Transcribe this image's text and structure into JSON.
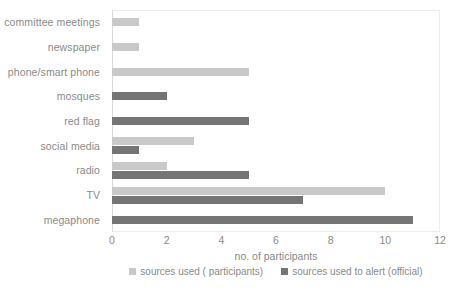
{
  "chart_data": {
    "type": "bar",
    "orientation": "horizontal",
    "title": "",
    "xlabel": "no. of participants",
    "ylabel": "",
    "xlim": [
      0,
      12
    ],
    "xticks": [
      0,
      2,
      4,
      6,
      8,
      10,
      12
    ],
    "grid": false,
    "legend_position": "bottom",
    "categories": [
      "committee meetings",
      "newspaper",
      "phone/smart phone",
      "mosques",
      "red flag",
      "social media",
      "radio",
      "TV",
      "megaphone"
    ],
    "series": [
      {
        "name": "sources used ( participants)",
        "color": "#c9c9c9",
        "values": [
          1,
          1,
          5,
          0,
          0,
          3,
          2,
          10,
          0
        ]
      },
      {
        "name": "sources used to alert (official)",
        "color": "#757575",
        "values": [
          0,
          0,
          0,
          2,
          5,
          1,
          5,
          7,
          11
        ]
      }
    ]
  },
  "axis": {
    "tick_labels": [
      "0",
      "2",
      "4",
      "6",
      "8",
      "10",
      "12"
    ]
  },
  "legend": {
    "items": [
      {
        "label": "sources used ( participants)",
        "color": "#c9c9c9"
      },
      {
        "label": "sources used to alert (official)",
        "color": "#757575"
      }
    ]
  }
}
